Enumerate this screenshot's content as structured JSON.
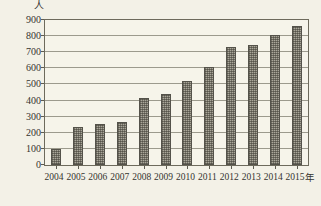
{
  "chart_data": {
    "type": "bar",
    "title": "",
    "xlabel": "年",
    "ylabel": "人",
    "categories": [
      "2004",
      "2005",
      "2006",
      "2007",
      "2008",
      "2009",
      "2010",
      "2011",
      "2012",
      "2013",
      "2014",
      "2015"
    ],
    "values": [
      100,
      235,
      255,
      265,
      415,
      440,
      520,
      610,
      730,
      745,
      810,
      860
    ],
    "ylim": [
      0,
      900
    ],
    "ytick_labels": [
      "900",
      "800",
      "700",
      "600",
      "500",
      "400",
      "300",
      "200",
      "100",
      "0"
    ],
    "ytick_values": [
      900,
      800,
      700,
      600,
      500,
      400,
      300,
      200,
      100,
      0
    ],
    "grid": true,
    "legend": "none",
    "series": [
      {
        "name": "人数",
        "values": [
          100,
          235,
          255,
          265,
          415,
          440,
          520,
          610,
          730,
          745,
          810,
          860
        ]
      }
    ],
    "bar_color": "#aaa79a",
    "axis_color": "#6d6a5c",
    "background_color": "#f3f1e7"
  },
  "axes": {
    "y_unit_label": "人",
    "x_unit_label": "年"
  }
}
